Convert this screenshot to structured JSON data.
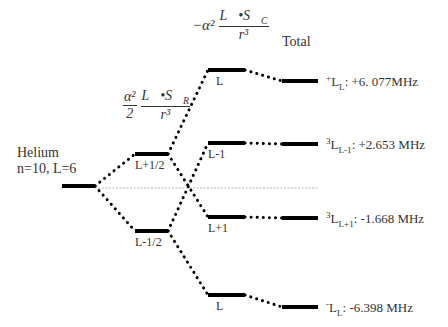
{
  "diagram": {
    "title_partial": "",
    "base_state": {
      "name": "Helium",
      "quantum": "n=10, L=6"
    },
    "columns": {
      "rel_formula": {
        "coef_num": "α²",
        "coef_den": "2",
        "num": "L⃗•S⃗",
        "num_sub": "R",
        "den": "r³"
      },
      "core_formula": {
        "prefix": "−α²",
        "num": "L⃗•S⃗",
        "num_sub": "C",
        "den": "r³"
      },
      "total_label": "Total"
    },
    "levels": {
      "base": {
        "x1": 62,
        "x2": 95,
        "y": 186
      },
      "mid": [
        {
          "label": "L+1/2",
          "x1": 135,
          "x2": 168,
          "y": 154
        },
        {
          "label": "L-1/2",
          "x1": 135,
          "x2": 168,
          "y": 231
        }
      ],
      "right": [
        {
          "label": "L",
          "x1": 208,
          "x2": 245,
          "y": 70
        },
        {
          "label": "L-1",
          "x1": 208,
          "x2": 245,
          "y": 143
        },
        {
          "label": "L+1",
          "x1": 208,
          "x2": 245,
          "y": 217
        },
        {
          "label": "L",
          "x1": 208,
          "x2": 245,
          "y": 295
        }
      ],
      "total": [
        {
          "x1": 282,
          "x2": 318,
          "y": 81
        },
        {
          "x1": 282,
          "x2": 318,
          "y": 144
        },
        {
          "x1": 282,
          "x2": 318,
          "y": 218
        },
        {
          "x1": 282,
          "x2": 318,
          "y": 307
        }
      ]
    },
    "results": [
      {
        "sup": "+",
        "main": "L",
        "sub": "L",
        "value": ": +6. 077MHz"
      },
      {
        "sup": "3",
        "main": "L",
        "sub": "L-1",
        "value": ": +2.653 MHz"
      },
      {
        "sup": "3",
        "main": "L",
        "sub": "L+1",
        "value": ": -1.668 MHz"
      },
      {
        "sup": "-",
        "main": "L",
        "sub": "L",
        "value": ": -6.398 MHz"
      }
    ],
    "reference_line_y": 188
  }
}
